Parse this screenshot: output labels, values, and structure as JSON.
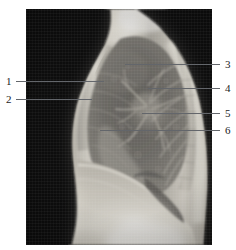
{
  "figure": {
    "kind": "lateral-chest-radiograph",
    "width_px": 236,
    "height_px": 250,
    "background_color": "#ffffff",
    "plate": {
      "left_px": 26,
      "top_px": 9,
      "width_px": 186,
      "height_px": 236,
      "film_background_color": "#070707",
      "soft_tissue_color": "#d8d5cd",
      "lung_field_color": "#6b6a66",
      "leader_line_color": "#63666b",
      "label_text_color": "#1b1b1b"
    },
    "labels": [
      {
        "id": "label-1",
        "text": "1",
        "side": "left",
        "text_x_px": 6,
        "text_y_px": 76,
        "line_x_px": 16,
        "line_y_px": 81,
        "line_width_px": 88
      },
      {
        "id": "label-2",
        "text": "2",
        "side": "left",
        "text_x_px": 6,
        "text_y_px": 94,
        "line_x_px": 16,
        "line_y_px": 99,
        "line_width_px": 76
      },
      {
        "id": "label-3",
        "text": "3",
        "side": "right",
        "text_x_px": 225,
        "text_y_px": 59,
        "line_x_px": 125,
        "line_y_px": 64,
        "line_width_px": 95
      },
      {
        "id": "label-4",
        "text": "4",
        "side": "right",
        "text_x_px": 225,
        "text_y_px": 83,
        "line_x_px": 148,
        "line_y_px": 88,
        "line_width_px": 72
      },
      {
        "id": "label-5",
        "text": "5",
        "side": "right",
        "text_x_px": 225,
        "text_y_px": 108,
        "line_x_px": 142,
        "line_y_px": 113,
        "line_width_px": 78
      },
      {
        "id": "label-6",
        "text": "6",
        "side": "right",
        "text_x_px": 225,
        "text_y_px": 125,
        "line_x_px": 100,
        "line_y_px": 130,
        "line_width_px": 120
      }
    ]
  }
}
